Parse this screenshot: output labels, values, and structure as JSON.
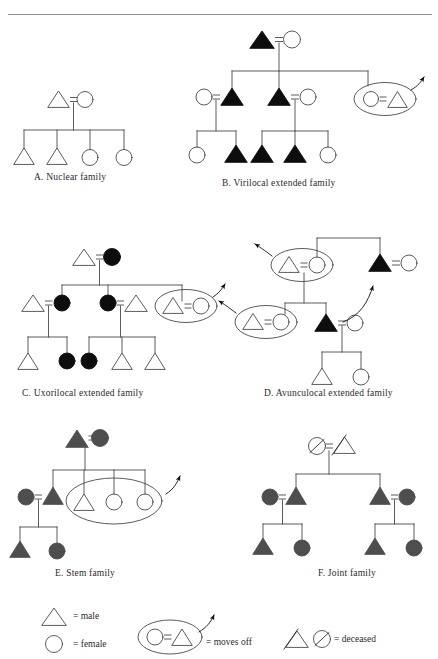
{
  "page": {
    "background_color": "#ffffff",
    "ink_color": "#1a1a1a",
    "line_color": "#4a4a4a",
    "fill_black": "#0d0d0d",
    "fill_gray": "#4e4e4e",
    "divider_color": "#8e8e8e"
  },
  "figures": [
    {
      "id": "A",
      "caption": "A. Nuclear family",
      "description": "Unfilled male married to unfilled female with four children: two males and two females.",
      "symbol_style": "outline"
    },
    {
      "id": "B",
      "caption": "B. Virilocal extended family",
      "description": "Filled male married to unfilled female; three children; married sons remain, daughter moves off.",
      "symbol_style": "black-filled"
    },
    {
      "id": "C",
      "caption": "C. Uxorilocal extended family",
      "description": "Unfilled male married to filled female; married daughters remain, son moves off.",
      "symbol_style": "black-filled"
    },
    {
      "id": "D",
      "caption": "D. Avunculocal extended family",
      "description": "Two circled couples move off; filled males reside with maternal uncle.",
      "symbol_style": "black-filled"
    },
    {
      "id": "E",
      "caption": "E. Stem family",
      "description": "Gray-filled male married to gray-filled female; one heir remains, three siblings circled and move off.",
      "symbol_style": "gray-filled"
    },
    {
      "id": "F",
      "caption": "F. Joint family",
      "description": "Deceased parents at top; two married brothers each with a son and a daughter.",
      "symbol_style": "gray-filled"
    }
  ],
  "legend": {
    "items": [
      {
        "key": "male",
        "symbol": "triangle-outline-icon",
        "label": "= male"
      },
      {
        "key": "female",
        "symbol": "circle-outline-icon",
        "label": "= female"
      },
      {
        "key": "moves_off",
        "symbol": "ellipse-arrow-icon",
        "label": "= moves off"
      },
      {
        "key": "deceased",
        "symbol": "slashed-symbols-icon",
        "label": "= deceased"
      }
    ]
  }
}
